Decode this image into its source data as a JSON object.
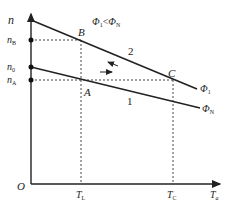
{
  "diagram": {
    "type": "mechanical-characteristic",
    "axes": {
      "y_label": "n",
      "x_label_main": "T",
      "x_label_sub": "a",
      "origin_label": "O"
    },
    "y_ticks": [
      {
        "main": "n",
        "sub": "B",
        "y": 40
      },
      {
        "main": "n",
        "sub": "0",
        "y": 67
      },
      {
        "main": "n",
        "sub": "A",
        "y": 80
      }
    ],
    "x_ticks": [
      {
        "main": "T",
        "sub": "L",
        "x": 81
      },
      {
        "main": "T",
        "sub": "C",
        "x": 173
      }
    ],
    "points": [
      {
        "label": "A",
        "x": 81,
        "y": 80
      },
      {
        "label": "B",
        "x": 81,
        "y": 40
      },
      {
        "label": "C",
        "x": 173,
        "y": 80
      }
    ],
    "curves": [
      {
        "id": "1",
        "label": "1",
        "flux_main": "Φ",
        "flux_sub": "N"
      },
      {
        "id": "2",
        "label": "2",
        "flux_main": "Φ",
        "flux_sub": "1"
      }
    ],
    "condition": {
      "left_main": "Φ",
      "left_sub": "1",
      "op": "<",
      "right_main": "Φ",
      "right_sub": "N"
    },
    "colors": {
      "line": "#222222",
      "background": "#ffffff"
    }
  }
}
